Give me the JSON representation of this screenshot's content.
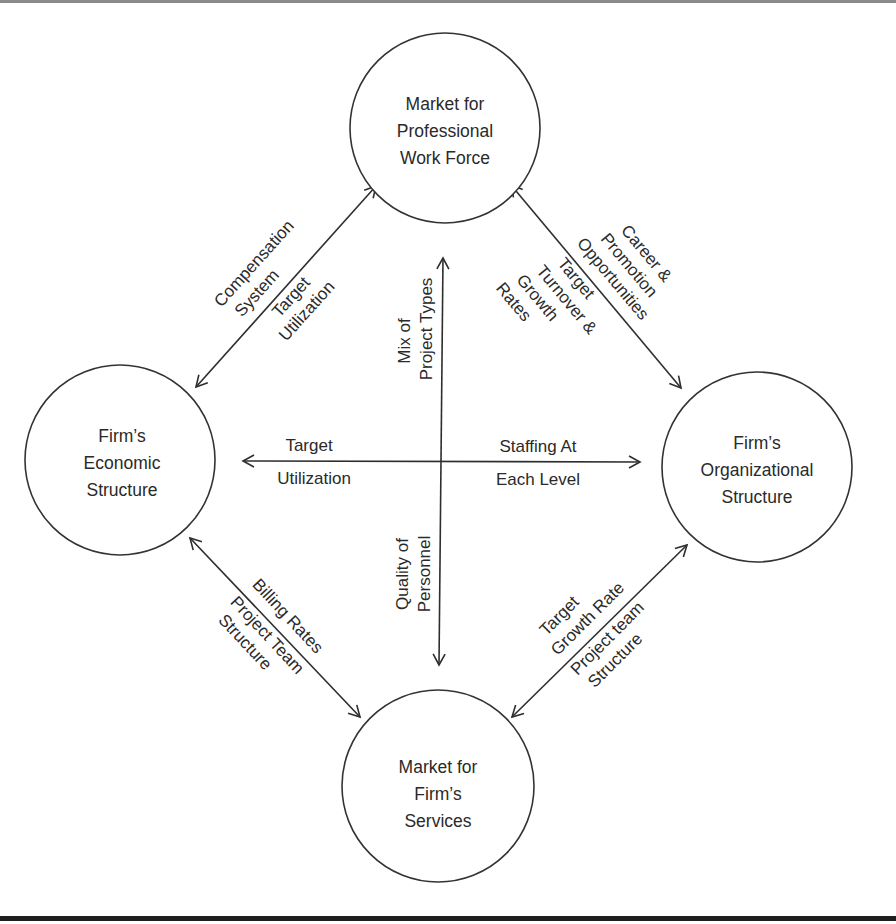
{
  "nodes": {
    "top": {
      "lines": [
        "Market for",
        "Professional",
        "Work Force"
      ]
    },
    "left": {
      "lines": [
        "Firm’s",
        "Economic",
        "Structure"
      ]
    },
    "right": {
      "lines": [
        "Firm’s",
        "Organizational",
        "Structure"
      ]
    },
    "bottom": {
      "lines": [
        "Market for",
        "Firm’s",
        "Services"
      ]
    }
  },
  "edges": {
    "top_left": {
      "above": [
        "Compensation",
        "System"
      ],
      "below": [
        "Target",
        "Utilization"
      ]
    },
    "top_right": {
      "above": [
        "Career &",
        "Promotion",
        "Opportunities"
      ],
      "below": [
        "Target",
        "Turnover &",
        "Growth",
        "Rates"
      ]
    },
    "bottom_left": {
      "above": [
        "Billing Rates"
      ],
      "below": [
        "Project Team",
        "Structure"
      ]
    },
    "bottom_right": {
      "above": [
        "Target",
        "Growth Rate"
      ],
      "below": [
        "Project team",
        "Structure"
      ]
    },
    "horizontal": {
      "left_above": "Target",
      "left_below": "Utilization",
      "right_above": "Staffing At",
      "right_below": "Each Level"
    },
    "vertical": {
      "upper": [
        "Mix of",
        "Project Types"
      ],
      "lower": [
        "Quality of",
        "Personnel"
      ]
    }
  },
  "colors": {
    "stroke": "#2e2e2e",
    "text": "#2a2a2a",
    "background": "#ffffff"
  }
}
